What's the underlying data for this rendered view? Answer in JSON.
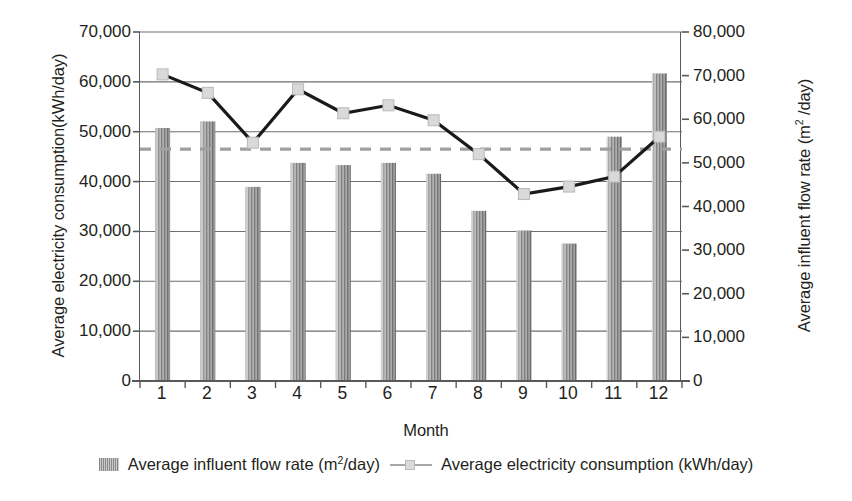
{
  "chart_data": {
    "type": "bar",
    "title": "",
    "subtitle": "",
    "xlabel": "Month",
    "categories": [
      "1",
      "2",
      "3",
      "4",
      "5",
      "6",
      "7",
      "8",
      "9",
      "10",
      "11",
      "12"
    ],
    "x_tick_labels": [
      "1",
      "2",
      "3",
      "4",
      "5",
      "6",
      "7",
      "8",
      "9",
      "10",
      "11",
      "12"
    ],
    "grid": true,
    "grid_axis": "y-left",
    "legend_position": "bottom-center",
    "axes": {
      "left": {
        "label": "Average electricity consumption(kWh/day)",
        "ylim": [
          0,
          70000
        ],
        "tick_step": 10000,
        "tick_labels": [
          "70,000",
          "60,000",
          "50,000",
          "40,000",
          "30,000",
          "20,000",
          "10,000",
          "0"
        ],
        "tick_values": [
          70000,
          60000,
          50000,
          40000,
          30000,
          20000,
          10000,
          0
        ]
      },
      "right": {
        "label": "Average influent flow rate (m2 /day)",
        "label_prefix": "Average influent flow rate (m",
        "label_sup": "2",
        "label_suffix": " /day)",
        "ylim": [
          0,
          80000
        ],
        "tick_step": 10000,
        "tick_labels": [
          "80,000",
          "70,000",
          "60,000",
          "50,000",
          "40,000",
          "30,000",
          "20,000",
          "10,000",
          "0"
        ],
        "tick_values": [
          80000,
          70000,
          60000,
          50000,
          40000,
          30000,
          20000,
          10000,
          0
        ]
      }
    },
    "series": [
      {
        "name": "Average influent flow rate (m2 /day)",
        "legend_prefix": "Average influent flow rate (m",
        "legend_sup": "2",
        "legend_suffix": "/day)",
        "type": "bar",
        "axis": "right",
        "unit": "m2/day",
        "color": "#8f8f8f",
        "values": [
          58000,
          59500,
          44500,
          50000,
          49500,
          50000,
          47500,
          39000,
          34500,
          31500,
          56000,
          70500
        ]
      },
      {
        "name": "Average electricity consumption (kWh/day)",
        "legend_label": "Average electricity consumption (kWh/day)",
        "type": "line",
        "axis": "left",
        "unit": "kWh/day",
        "color": "#1a1a1a",
        "marker_color": "#d9d9d9",
        "values": [
          61500,
          57800,
          47800,
          58500,
          53700,
          55300,
          52300,
          45500,
          37500,
          39000,
          41000,
          49000
        ]
      }
    ],
    "reference_line": {
      "name": "average-reference-line",
      "axis": "left",
      "value": 46500,
      "style": "dashed",
      "color": "#a0a0a0"
    }
  },
  "legend": {
    "items": [
      {
        "key": "influent-flow-rate",
        "marker": "bar-swatch",
        "prefix": "Average influent flow rate (m",
        "sup": "2",
        "suffix": "/day)"
      },
      {
        "key": "electricity-consumption",
        "marker": "line-marker-swatch",
        "label": "Average electricity consumption (kWh/day)"
      }
    ]
  }
}
